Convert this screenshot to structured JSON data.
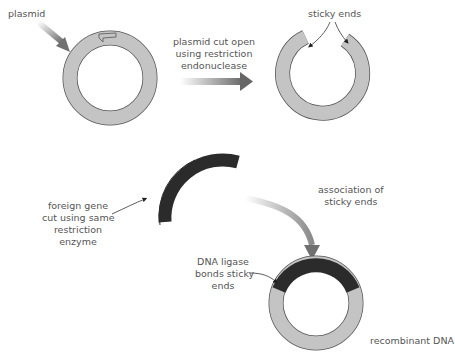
{
  "labels": {
    "plasmid": "plasmid",
    "cut_open": [
      "plasmid cut open",
      "using restriction",
      "endonuclease"
    ],
    "sticky_ends": "sticky ends",
    "association": [
      "association of",
      "sticky ends"
    ],
    "foreign_gene": [
      "foreign gene",
      "cut using same",
      "restriction",
      "enzyme"
    ],
    "ligase": [
      "DNA ligase",
      "bonds sticky",
      "ends"
    ],
    "recombinant": "recombinant DNA"
  },
  "colors": {
    "plasmid_fill": "#c4c4c4",
    "plasmid_stroke": "#555555",
    "foreign_dna": "#2b2b2b",
    "arrow": "#777777",
    "text": "#555555"
  }
}
